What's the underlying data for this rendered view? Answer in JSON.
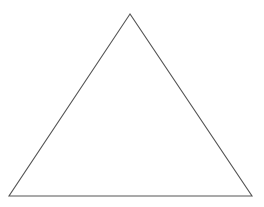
{
  "diagram": {
    "shape": "triangle",
    "background": "#ffffff",
    "stroke_color": "#555555",
    "fill_color": "none",
    "stroke_width": 1.1,
    "vertices": {
      "apex": {
        "x": 130,
        "y": 14
      },
      "bottom_left": {
        "x": 9,
        "y": 196
      },
      "bottom_right": {
        "x": 252,
        "y": 196
      }
    }
  }
}
